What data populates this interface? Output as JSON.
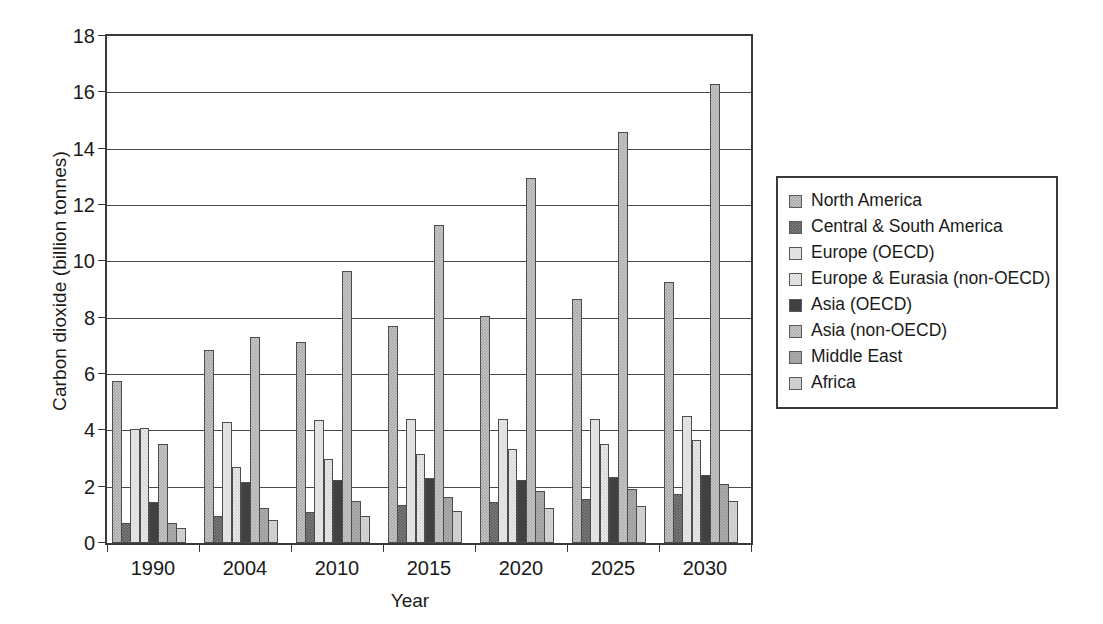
{
  "chart_data": {
    "type": "bar",
    "title": "",
    "xlabel": "Year",
    "ylabel": "Carbon dioxide (billion tonnes)",
    "categories": [
      "1990",
      "2004",
      "2010",
      "2015",
      "2020",
      "2025",
      "2030"
    ],
    "ylim": [
      0,
      18
    ],
    "yticks": [
      0,
      2,
      4,
      6,
      8,
      10,
      12,
      14,
      16,
      18
    ],
    "ytick_labels": [
      "0",
      "2",
      "4",
      "6",
      "8",
      "10",
      "12",
      "14",
      "16",
      "18"
    ],
    "grid": true,
    "legend_position": "right",
    "series": [
      {
        "name": "North America",
        "color": "#a8a8a8",
        "values": [
          5.75,
          6.85,
          7.15,
          7.7,
          8.05,
          8.65,
          9.25
        ]
      },
      {
        "name": "Central & South America",
        "color": "#5e5e5e",
        "values": [
          0.7,
          0.95,
          1.1,
          1.35,
          1.45,
          1.55,
          1.75
        ]
      },
      {
        "name": "Europe (OECD)",
        "color": "#e2e2e2",
        "values": [
          4.05,
          4.3,
          4.35,
          4.4,
          4.4,
          4.4,
          4.5
        ]
      },
      {
        "name": "Europe & Eurasia (non-OECD)",
        "color": "#ececec",
        "values": [
          4.1,
          2.7,
          3.0,
          3.15,
          3.35,
          3.5,
          3.65
        ]
      },
      {
        "name": "Asia (OECD)",
        "color": "#414141",
        "values": [
          1.45,
          2.15,
          2.25,
          2.3,
          2.25,
          2.35,
          2.4
        ]
      },
      {
        "name": "Asia (non-OECD)",
        "color": "#b0b0b0",
        "values": [
          3.5,
          7.3,
          9.65,
          11.3,
          12.95,
          14.6,
          16.3
        ]
      },
      {
        "name": "Middle East",
        "color": "#999999",
        "values": [
          0.7,
          1.25,
          1.5,
          1.65,
          1.85,
          1.9,
          2.1
        ]
      },
      {
        "name": "Africa",
        "color": "#d5d5d5",
        "values": [
          0.55,
          0.8,
          0.95,
          1.15,
          1.25,
          1.3,
          1.5
        ]
      }
    ]
  }
}
